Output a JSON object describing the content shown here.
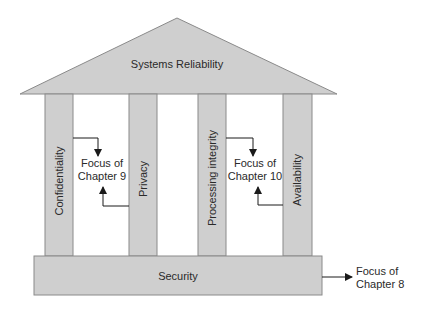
{
  "diagram": {
    "type": "temple",
    "colors": {
      "fill": "#cfcfcf",
      "stroke": "#8a8a8a",
      "arrow": "#1a1a1a",
      "text": "#2a2a2a"
    },
    "roof": {
      "label": "Systems Reliability"
    },
    "pillars": [
      {
        "label": "Confidentiality"
      },
      {
        "label": "Privacy"
      },
      {
        "label": "Processing integrity"
      },
      {
        "label": "Availability"
      }
    ],
    "base": {
      "label": "Security"
    },
    "annotations": [
      {
        "line1": "Focus of",
        "line2": "Chapter 9",
        "applies_to": [
          "Confidentiality",
          "Privacy"
        ]
      },
      {
        "line1": "Focus of",
        "line2": "Chapter 10",
        "applies_to": [
          "Processing integrity",
          "Availability"
        ]
      },
      {
        "line1": "Focus of",
        "line2": "Chapter 8",
        "applies_to": [
          "Security"
        ]
      }
    ]
  }
}
